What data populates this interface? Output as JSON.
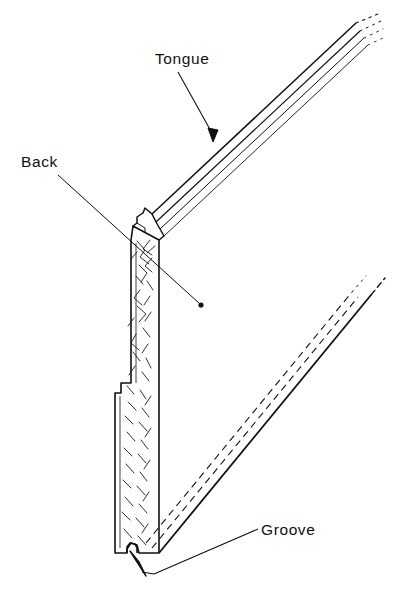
{
  "figure": {
    "background_color": "#ffffff",
    "line_color": "#111111",
    "grain_color": "#1a1a1a",
    "width": 404,
    "height": 610
  },
  "labels": [
    {
      "id": "tongue",
      "text": "Tongue",
      "x": 155,
      "y": 51,
      "leader": "line from label down-right to arrowhead on tongue edge"
    },
    {
      "id": "back",
      "text": "Back",
      "x": 21,
      "y": 154,
      "leader": "line from label down-right ending in dot on board end grain"
    },
    {
      "id": "groove",
      "text": "Groove",
      "x": 261,
      "y": 522,
      "leader": "line from label left and down, then up-left to arrowhead at groove notch"
    }
  ],
  "parts": {
    "tongue_label": "Tongue",
    "back_label": "Back",
    "groove_label": "Groove"
  }
}
